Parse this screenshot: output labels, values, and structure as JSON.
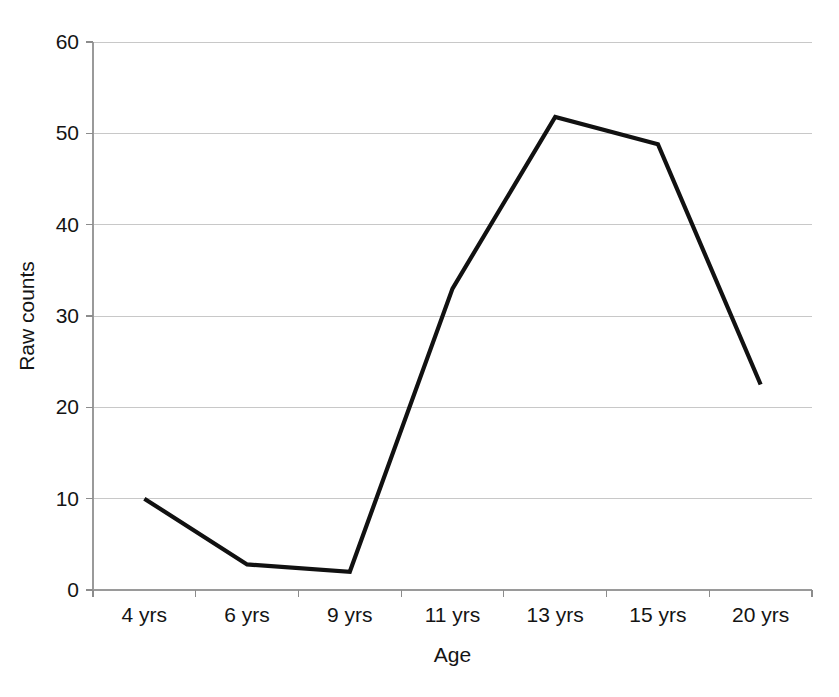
{
  "chart_data": {
    "type": "line",
    "title": "",
    "xlabel": "Age",
    "ylabel": "Raw counts",
    "categories": [
      "4 yrs",
      "6 yrs",
      "9 yrs",
      "11 yrs",
      "13 yrs",
      "15 yrs",
      "20 yrs"
    ],
    "values": [
      10,
      2.8,
      2,
      33,
      51.8,
      48.8,
      22.5
    ],
    "series": [
      {
        "name": "Raw counts",
        "values": [
          10,
          2.8,
          2,
          33,
          51.8,
          48.8,
          22.5
        ],
        "color": "#111111"
      }
    ],
    "ylim": [
      0,
      60
    ],
    "yticks": [
      0,
      10,
      20,
      30,
      40,
      50,
      60
    ],
    "ytick_labels": [
      "0",
      "10",
      "20",
      "30",
      "40",
      "50",
      "60"
    ],
    "grid": true,
    "grid_axis": "y",
    "grid_color": "#c8c8c8",
    "legend": false,
    "legend_position": "none",
    "background_color": "#ffffff",
    "line_color": "#111111",
    "line_width": 4.2
  },
  "layout": {
    "plot_left": 93,
    "plot_right": 812,
    "plot_top": 42,
    "plot_bottom": 590,
    "xlabel_y": 622,
    "xtitle_y": 662,
    "ytitle_x": 34,
    "ytitle_y": 316
  }
}
